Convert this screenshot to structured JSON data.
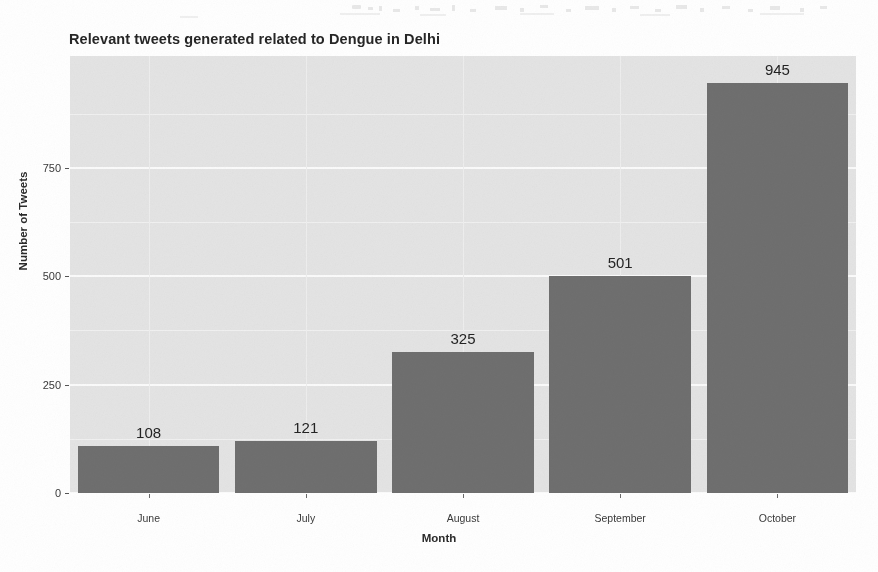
{
  "chart_data": {
    "type": "bar",
    "title": "Relevant tweets generated related to Dengue in Delhi",
    "xlabel": "Month",
    "ylabel": "Number of Tweets",
    "categories": [
      "June",
      "July",
      "August",
      "September",
      "October"
    ],
    "values": [
      108,
      121,
      325,
      501,
      945
    ],
    "value_labels": [
      "108",
      "121",
      "325",
      "501",
      "945"
    ],
    "ylim": [
      0,
      1008
    ],
    "y_ticks": [
      0,
      250,
      500,
      750
    ],
    "y_tick_labels": [
      "0",
      "250",
      "500",
      "750"
    ],
    "y_minor_ticks": [
      125,
      375,
      625,
      875
    ],
    "grid": true,
    "legend": "none",
    "bar_color": "#6f6f6f",
    "panel_color": "#e4e4e4",
    "gridline_color": "#fbfbfb"
  }
}
